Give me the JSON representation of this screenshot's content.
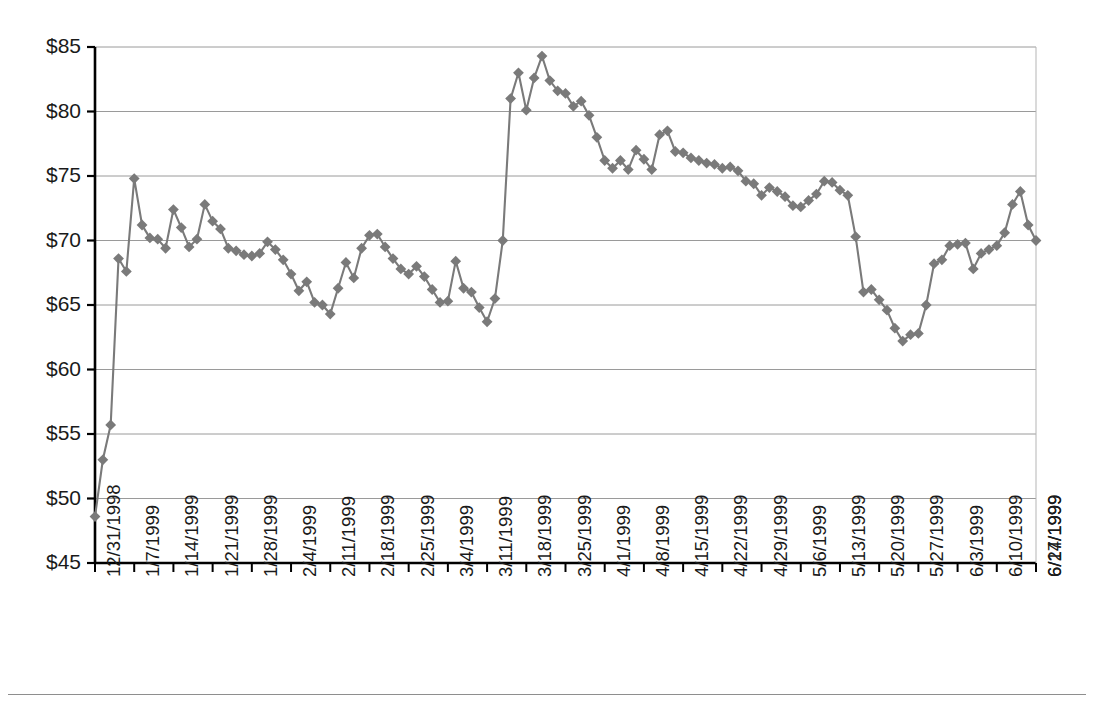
{
  "chart_data": {
    "type": "line",
    "title": "",
    "xlabel": "",
    "ylabel": "",
    "ylim": [
      45,
      85
    ],
    "ytick_step": 5,
    "ytick_labels": [
      "$85",
      "$80",
      "$75",
      "$70",
      "$65",
      "$60",
      "$55",
      "$50",
      "$45"
    ],
    "ytick_values": [
      85,
      80,
      75,
      70,
      65,
      60,
      55,
      50,
      45
    ],
    "grid": true,
    "grid_axis": "y",
    "legend": false,
    "marker": "diamond",
    "marker_color": "#7a7a7a",
    "line_color": "#7a7a7a",
    "axis_color": "#000000",
    "gridline_color": "#9a9a9a",
    "xtick_labels": [
      "12/31/1998",
      "1/7/1999",
      "1/14/1999",
      "1/21/1999",
      "1/28/1999",
      "2/4/1999",
      "2/11/1999",
      "2/18/1999",
      "2/25/1999",
      "3/4/1999",
      "3/11/1999",
      "3/18/1999",
      "3/25/1999",
      "4/1/1999",
      "4/8/1999",
      "4/15/1999",
      "4/22/1999",
      "4/29/1999",
      "5/6/1999",
      "5/13/1999",
      "5/20/1999",
      "5/27/1999",
      "6/3/1999",
      "6/10/1999",
      "6/17/1999",
      "6/24/1999"
    ],
    "xtick_interval_points": 5,
    "xtick_rotation": -90,
    "series": [
      {
        "name": "Price",
        "values": [
          48.6,
          53.0,
          55.7,
          68.6,
          67.6,
          74.8,
          71.2,
          70.2,
          70.1,
          69.4,
          72.4,
          71.0,
          69.5,
          70.1,
          72.8,
          71.5,
          70.9,
          69.4,
          69.2,
          68.9,
          68.8,
          69.0,
          69.9,
          69.3,
          68.5,
          67.4,
          66.1,
          66.8,
          65.2,
          65.0,
          64.3,
          66.3,
          68.3,
          67.1,
          69.4,
          70.4,
          70.5,
          69.5,
          68.6,
          67.8,
          67.4,
          68.0,
          67.2,
          66.2,
          65.2,
          65.3,
          68.4,
          66.3,
          66.0,
          64.8,
          63.7,
          65.5,
          70.0,
          81.0,
          83.0,
          80.1,
          82.6,
          84.3,
          82.4,
          81.6,
          81.4,
          80.4,
          80.8,
          79.7,
          78.0,
          76.2,
          75.6,
          76.2,
          75.5,
          77.0,
          76.3,
          75.5,
          78.2,
          78.5,
          76.9,
          76.8,
          76.4,
          76.2,
          76.0,
          75.9,
          75.6,
          75.7,
          75.4,
          74.6,
          74.4,
          73.5,
          74.1,
          73.8,
          73.4,
          72.7,
          72.6,
          73.1,
          73.6,
          74.6,
          74.5,
          73.9,
          73.5,
          70.3,
          66.0,
          66.2,
          65.4,
          64.6,
          63.2,
          62.2,
          62.7,
          62.8,
          65.0,
          68.2,
          68.5,
          69.6,
          69.7,
          69.8,
          67.8,
          69.0,
          69.3,
          69.6,
          70.6,
          72.8,
          73.8,
          71.2,
          70.0
        ]
      }
    ],
    "annotations": []
  },
  "axes": {
    "y_axis_name": "price-axis",
    "x_axis_name": "date-axis"
  }
}
